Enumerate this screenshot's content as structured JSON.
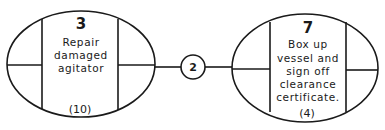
{
  "diagram": {
    "nodes": [
      {
        "id": "left",
        "number": "3",
        "description_lines": [
          "Repair",
          "damaged",
          "agitator"
        ],
        "duration": "(10)"
      },
      {
        "id": "right",
        "number": "7",
        "description_lines": [
          "Box up",
          "vessel and",
          "sign off",
          "clearance",
          "certificate."
        ],
        "duration": "(4)"
      }
    ],
    "connector": {
      "label": "2"
    },
    "colors": {
      "stroke": "#1a1a1a",
      "background": "#ffffff"
    }
  }
}
